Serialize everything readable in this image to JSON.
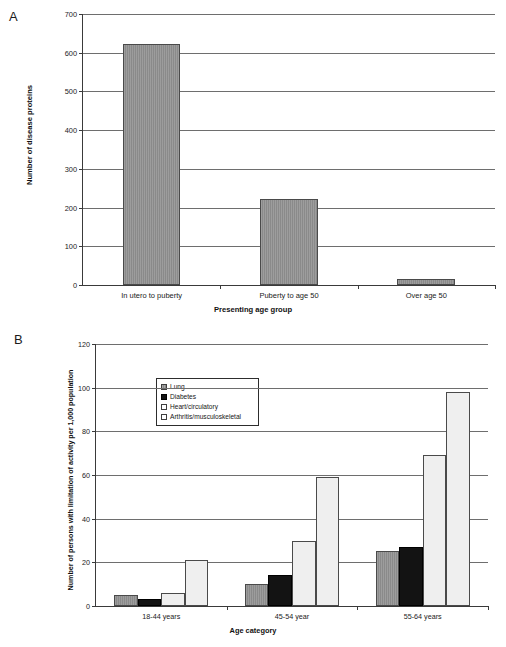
{
  "figure": {
    "panels": [
      {
        "letter": "A",
        "ylabel": "Number of disease proteins",
        "xlabel": "Presenting age group"
      },
      {
        "letter": "B",
        "ylabel": "Number of persons with limitation of activity per 1,000 population",
        "xlabel": "Age category"
      }
    ]
  },
  "chart_data": [
    {
      "type": "bar",
      "title": "A",
      "categories": [
        "In utero to puberty",
        "Puberty to age 50",
        "Over age 50"
      ],
      "values": [
        623,
        223,
        15
      ],
      "series": [
        {
          "name": "Number of disease proteins",
          "values": [
            623,
            223,
            15
          ]
        }
      ],
      "xlabel": "Presenting age group",
      "ylabel": "Number of disease proteins",
      "ylim": [
        0,
        700
      ],
      "yticks": [
        0,
        100,
        200,
        300,
        400,
        500,
        600,
        700
      ],
      "ytick_labels": [
        "0",
        "100",
        "200",
        "300",
        "400",
        "500",
        "600",
        "700"
      ],
      "grid": true,
      "legend": null,
      "bar_color": "#8a8a8a"
    },
    {
      "type": "bar",
      "title": "B",
      "categories": [
        "18-44 years",
        "45-54 year",
        "55-64 years"
      ],
      "series": [
        {
          "name": "Lung",
          "values": [
            5,
            10,
            25
          ],
          "color": "#8a8a8a",
          "swatch": "grey"
        },
        {
          "name": "Diabetes",
          "values": [
            3,
            14,
            27
          ],
          "color": "#131313",
          "swatch": "black"
        },
        {
          "name": "Heart/circulatory",
          "values": [
            6,
            30,
            69
          ],
          "color": "#efefef",
          "swatch": "white"
        },
        {
          "name": "Arthritis/musculoskeletal",
          "values": [
            21,
            59,
            98
          ],
          "color": "#efefef",
          "swatch": "white"
        }
      ],
      "xlabel": "Age category",
      "ylabel": "Number of persons with limitation of activity per 1,000 population",
      "ylim": [
        0,
        120
      ],
      "yticks": [
        0,
        20,
        40,
        60,
        80,
        100,
        120
      ],
      "ytick_labels": [
        "0",
        "20",
        "40",
        "60",
        "80",
        "100",
        "120"
      ],
      "grid": true,
      "legend_position": "upper-left-inside"
    }
  ]
}
